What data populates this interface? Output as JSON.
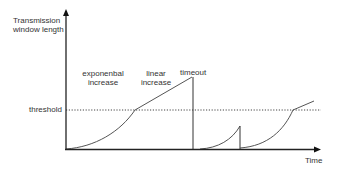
{
  "diagram": {
    "type": "tcp-congestion-window",
    "y_axis_label_line1": "Transmission",
    "y_axis_label_line2": "window length",
    "x_axis_label": "Time",
    "threshold_label": "threshold",
    "phase1_line1": "exponenbal",
    "phase1_line2": "increase",
    "phase2_line1": "linear",
    "phase2_line2": "increase",
    "event_label": "timeout",
    "colors": {
      "axis": "#222222",
      "curve": "#555555",
      "threshold_line": "#444444",
      "text": "#333333"
    }
  }
}
